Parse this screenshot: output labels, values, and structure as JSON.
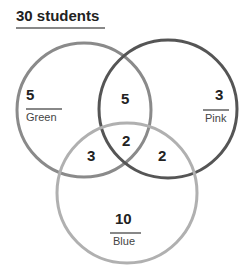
{
  "header": {
    "title": "30 students"
  },
  "colors": {
    "green_circle": "#8a8a8a",
    "pink_circle": "#555555",
    "blue_circle": "#b0b0b0",
    "text": "#222222",
    "rule": "#888888"
  },
  "sets": [
    {
      "name": "Green",
      "only": "5"
    },
    {
      "name": "Pink",
      "only": "3"
    },
    {
      "name": "Blue",
      "only": "10"
    }
  ],
  "intersections": {
    "green_pink": "5",
    "green_blue": "3",
    "pink_blue": "2",
    "all_three": "2"
  }
}
